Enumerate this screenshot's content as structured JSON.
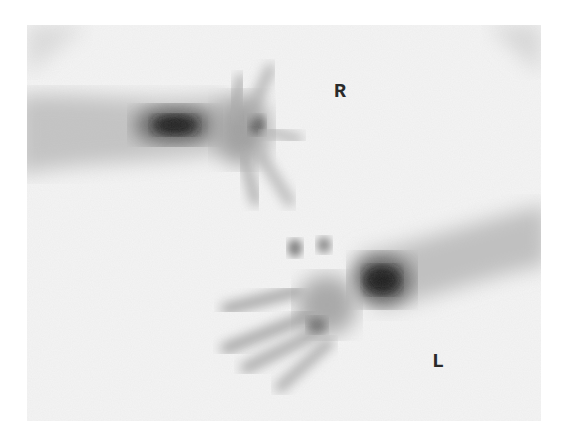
{
  "image": {
    "type": "bone scintigraphy of hands",
    "labels": {
      "right": "R",
      "left": "L"
    },
    "colors": {
      "background": "#f4f4f4",
      "uptake_dark": "#1a1a1a"
    }
  }
}
